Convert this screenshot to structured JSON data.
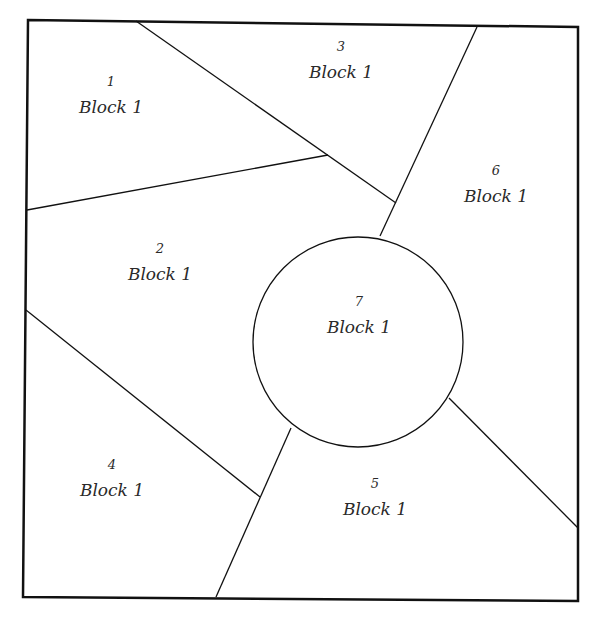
{
  "diagram": {
    "type": "quilt-block-pattern",
    "colors": {
      "line": "#111111",
      "background": "#ffffff",
      "text": "#2a2a2a"
    },
    "pieces": [
      {
        "id": "piece-1",
        "number": "1",
        "label": "Block 1",
        "x": 111,
        "y": 74
      },
      {
        "id": "piece-2",
        "number": "2",
        "label": "Block 1",
        "x": 160,
        "y": 241
      },
      {
        "id": "piece-3",
        "number": "3",
        "label": "Block 1",
        "x": 341,
        "y": 39
      },
      {
        "id": "piece-4",
        "number": "4",
        "label": "Block 1",
        "x": 112,
        "y": 457
      },
      {
        "id": "piece-5",
        "number": "5",
        "label": "Block 1",
        "x": 375,
        "y": 476
      },
      {
        "id": "piece-6",
        "number": "6",
        "label": "Block 1",
        "x": 496,
        "y": 163
      },
      {
        "id": "piece-7",
        "number": "7",
        "label": "Block 1",
        "x": 359,
        "y": 294
      }
    ]
  }
}
